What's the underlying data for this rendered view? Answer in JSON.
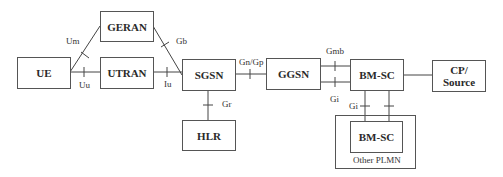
{
  "diagram": {
    "type": "network-architecture",
    "nodes": {
      "ue": "UE",
      "geran": "GERAN",
      "utran": "UTRAN",
      "sgsn": "SGSN",
      "hlr": "HLR",
      "ggsn": "GGSN",
      "bmsc": "BM-SC",
      "cp_source": "CP/\nSource",
      "bmsc_other": "BM-SC"
    },
    "regions": {
      "other_plmn": "Other PLMN"
    },
    "interfaces": {
      "um": "Um",
      "uu": "Uu",
      "gb": "Gb",
      "iu": "Iu",
      "gr": "Gr",
      "gn_gp": "Gn/Gp",
      "gmb": "Gmb",
      "gi_left": "Gi",
      "gi_right": "Gi"
    },
    "edges": [
      {
        "from": "UE",
        "to": "GERAN",
        "label": "Um"
      },
      {
        "from": "UE",
        "to": "UTRAN",
        "label": "Uu"
      },
      {
        "from": "GERAN",
        "to": "SGSN",
        "label": "Gb"
      },
      {
        "from": "UTRAN",
        "to": "SGSN",
        "label": "Iu"
      },
      {
        "from": "SGSN",
        "to": "HLR",
        "label": "Gr"
      },
      {
        "from": "SGSN",
        "to": "GGSN",
        "label": "Gn/Gp"
      },
      {
        "from": "GGSN",
        "to": "BM-SC",
        "label": "Gmb"
      },
      {
        "from": "GGSN",
        "to": "BM-SC",
        "label": "Gi"
      },
      {
        "from": "BM-SC",
        "to": "CP/Source",
        "label": ""
      },
      {
        "from": "BM-SC",
        "to": "BM-SC (Other PLMN)",
        "label": "Gi"
      },
      {
        "from": "BM-SC",
        "to": "BM-SC (Other PLMN)",
        "label": ""
      }
    ]
  }
}
